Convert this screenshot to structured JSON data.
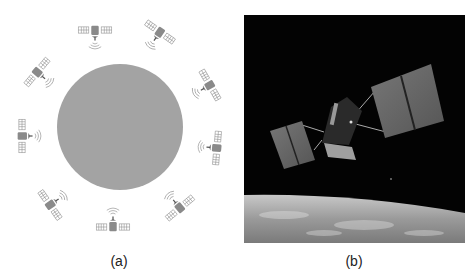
{
  "figure": {
    "panel_a": {
      "caption": "(a)",
      "description": "Satellite constellation orbiting Earth",
      "earth": {
        "cx": 120,
        "cy": 127,
        "r": 63,
        "color": "#a3a3a3"
      },
      "satellite_color": "#8a8a8a",
      "satellites": [
        {
          "x": 95,
          "y": 30,
          "angle": 180
        },
        {
          "x": 160,
          "y": 32,
          "angle": 215
        },
        {
          "x": 37,
          "y": 72,
          "angle": 130
        },
        {
          "x": 210,
          "y": 85,
          "angle": 240
        },
        {
          "x": 22,
          "y": 136,
          "angle": 90
        },
        {
          "x": 217,
          "y": 148,
          "angle": 275
        },
        {
          "x": 50,
          "y": 205,
          "angle": 55
        },
        {
          "x": 113,
          "y": 227,
          "angle": 0
        },
        {
          "x": 180,
          "y": 208,
          "angle": 320
        }
      ]
    },
    "panel_b": {
      "caption": "(b)",
      "description": "Photo of a satellite in orbit above Earth"
    }
  }
}
